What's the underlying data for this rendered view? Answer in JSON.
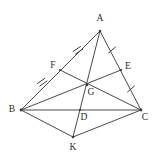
{
  "figure": {
    "background_color": "#ffffff",
    "line_color": "#4a4a4a",
    "label_color": "#2b2b2b",
    "width": 155,
    "height": 157
  },
  "points": {
    "A": {
      "label": "A",
      "x": 100,
      "y": 31,
      "label_x": 100,
      "label_y": 19
    },
    "B": {
      "label": "B",
      "x": 21,
      "y": 110,
      "label_x": 12,
      "label_y": 110
    },
    "C": {
      "label": "C",
      "x": 141,
      "y": 110,
      "label_x": 145,
      "label_y": 118
    },
    "D": {
      "label": "D",
      "x": 80,
      "y": 110,
      "label_x": 84,
      "label_y": 118
    },
    "E": {
      "label": "E",
      "x": 121,
      "y": 70,
      "label_x": 128,
      "label_y": 67
    },
    "F": {
      "label": "F",
      "x": 60,
      "y": 70,
      "label_x": 53,
      "label_y": 66
    },
    "G": {
      "label": "G",
      "x": 87,
      "y": 85,
      "label_x": 91,
      "label_y": 93
    },
    "K": {
      "label": "K",
      "x": 73,
      "y": 137,
      "label_x": 73,
      "label_y": 148
    }
  },
  "segments": [
    {
      "name": "side-AB",
      "from": "A",
      "to": "B"
    },
    {
      "name": "side-AC",
      "from": "A",
      "to": "C"
    },
    {
      "name": "side-BC",
      "from": "B",
      "to": "C"
    },
    {
      "name": "median-BE",
      "from": "B",
      "to": "E"
    },
    {
      "name": "median-CF",
      "from": "C",
      "to": "F"
    },
    {
      "name": "median-AK",
      "from": "A",
      "to": "K"
    },
    {
      "name": "segment-BK",
      "from": "B",
      "to": "K"
    },
    {
      "name": "segment-CK",
      "from": "C",
      "to": "K"
    }
  ],
  "tick_marks": [
    {
      "name": "tick-AF",
      "on": "A-F",
      "x": 78,
      "y": 50,
      "count": 2,
      "meaning": "AF equals FB"
    },
    {
      "name": "tick-FB",
      "on": "F-B",
      "x": 42,
      "y": 82,
      "count": 2,
      "meaning": "AF equals FB"
    },
    {
      "name": "tick-AE",
      "on": "A-E",
      "x": 112,
      "y": 50,
      "count": 1,
      "meaning": "AE equals EC"
    },
    {
      "name": "tick-EC",
      "on": "E-C",
      "x": 131,
      "y": 89,
      "count": 1,
      "meaning": "AE equals EC"
    }
  ],
  "vertex_labels": [
    "A",
    "F",
    "E",
    "B",
    "G",
    "D",
    "C",
    "K"
  ]
}
